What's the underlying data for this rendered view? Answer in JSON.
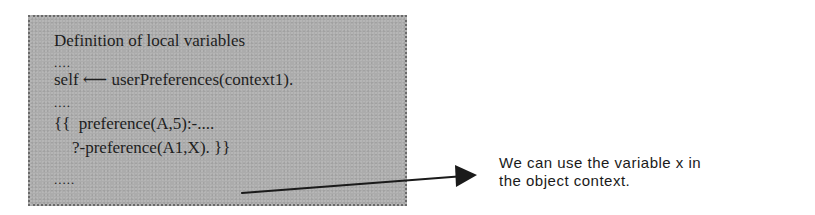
{
  "code_box": {
    "lines": {
      "title": "Definition of local variables",
      "dots1": "....",
      "self_line": "self ⟵ userPreferences(context1).",
      "dots2": "....",
      "pref_line": "{{  preference(A,5):-....",
      "query_line": "?-preference(A1,X). }}",
      "dots3": "....."
    },
    "background_color": "#acacac",
    "border_color": "#6a6a6a"
  },
  "arrow": {
    "icon": "arrow-right-icon",
    "from": [
      242,
      193
    ],
    "to": [
      477,
      175
    ],
    "color": "#1a1a1a"
  },
  "note": {
    "line1": "We can use the variable x in",
    "line2": "the object context."
  }
}
